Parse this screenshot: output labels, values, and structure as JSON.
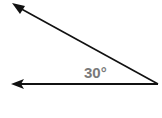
{
  "diagram": {
    "type": "angle",
    "angle_label": "30°",
    "vertex": [
      158,
      84
    ],
    "ray_upper_end": [
      13,
      4
    ],
    "ray_lower_end": [
      12,
      84
    ],
    "line_color": "#111111",
    "label_color": "#7a7a7a"
  }
}
